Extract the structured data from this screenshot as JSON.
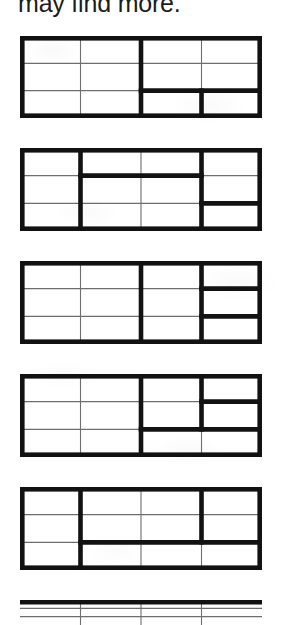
{
  "page": {
    "caption": "may find more.",
    "background_color": "#ffffff",
    "thin_line_color": "#6e6e6e",
    "bold_line_color": "#121212"
  },
  "figures": {
    "count": 6,
    "grid_columns": 4,
    "grid_rows": 3,
    "items": [
      {
        "index": 1,
        "label": "grid-figure-1",
        "top": 36,
        "height": 82,
        "complete": true,
        "bold_vertical_segments": [
          {
            "x": 2,
            "row_start": 0,
            "row_end": 3
          },
          {
            "x": 3,
            "row_start": 2,
            "row_end": 3
          }
        ],
        "bold_horizontal_segments": [
          {
            "y": 2,
            "col_start": 2,
            "col_end": 4
          }
        ]
      },
      {
        "index": 2,
        "label": "grid-figure-2",
        "top": 148,
        "height": 83,
        "complete": true,
        "bold_vertical_segments": [
          {
            "x": 1,
            "row_start": 0,
            "row_end": 3
          },
          {
            "x": 3,
            "row_start": 0,
            "row_end": 3
          }
        ],
        "bold_horizontal_segments": [
          {
            "y": 1,
            "col_start": 1,
            "col_end": 3
          },
          {
            "y": 2,
            "col_start": 3,
            "col_end": 4
          }
        ]
      },
      {
        "index": 3,
        "label": "grid-figure-3",
        "top": 261,
        "height": 83,
        "complete": true,
        "bold_vertical_segments": [
          {
            "x": 2,
            "row_start": 0,
            "row_end": 3
          },
          {
            "x": 3,
            "row_start": 0,
            "row_end": 3
          }
        ],
        "bold_horizontal_segments": [
          {
            "y": 1,
            "col_start": 3,
            "col_end": 4
          },
          {
            "y": 2,
            "col_start": 3,
            "col_end": 4
          }
        ]
      },
      {
        "index": 4,
        "label": "grid-figure-4",
        "top": 374,
        "height": 83,
        "complete": true,
        "bold_vertical_segments": [
          {
            "x": 2,
            "row_start": 0,
            "row_end": 3
          },
          {
            "x": 3,
            "row_start": 0,
            "row_end": 2
          }
        ],
        "bold_horizontal_segments": [
          {
            "y": 1,
            "col_start": 3,
            "col_end": 4
          },
          {
            "y": 2,
            "col_start": 2,
            "col_end": 4
          }
        ]
      },
      {
        "index": 5,
        "label": "grid-figure-5",
        "top": 487,
        "height": 83,
        "complete": true,
        "bold_vertical_segments": [
          {
            "x": 1,
            "row_start": 0,
            "row_end": 3
          },
          {
            "x": 3,
            "row_start": 0,
            "row_end": 2
          }
        ],
        "bold_horizontal_segments": [
          {
            "y": 2,
            "col_start": 1,
            "col_end": 4
          }
        ]
      },
      {
        "index": 6,
        "label": "grid-figure-6",
        "top": 600,
        "height": 25,
        "complete": false,
        "bold_vertical_segments": [],
        "bold_horizontal_segments": []
      }
    ]
  }
}
